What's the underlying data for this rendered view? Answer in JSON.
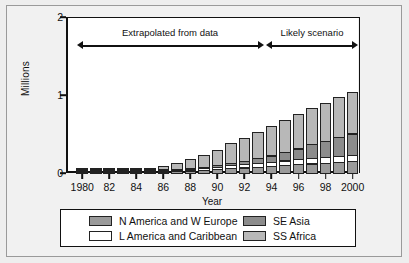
{
  "chart_data": {
    "type": "bar",
    "stacked": true,
    "title": "",
    "xlabel": "Year",
    "ylabel": "Millions",
    "ylim": [
      0,
      2
    ],
    "yticks": [
      "0",
      "1",
      "2"
    ],
    "ytick_values": [
      0,
      1,
      2
    ],
    "grid": false,
    "legend_position": "bottom",
    "x": [
      1980,
      1981,
      1982,
      1983,
      1984,
      1985,
      1986,
      1987,
      1988,
      1989,
      1990,
      1991,
      1992,
      1993,
      1994,
      1995,
      1996,
      1997,
      1998,
      1999,
      2000
    ],
    "xtick_labels": [
      "1980",
      "82",
      "84",
      "86",
      "88",
      "90",
      "92",
      "94",
      "96",
      "98",
      "2000"
    ],
    "xtick_years": [
      1980,
      1982,
      1984,
      1986,
      1988,
      1990,
      1992,
      1994,
      1996,
      1998,
      2000
    ],
    "categories": [
      "1980",
      "1981",
      "1982",
      "1983",
      "1984",
      "1985",
      "1986",
      "1987",
      "1988",
      "1989",
      "1990",
      "1991",
      "1992",
      "1993",
      "1994",
      "1995",
      "1996",
      "1997",
      "1998",
      "1999",
      "2000"
    ],
    "series": [
      {
        "name": "N America and W Europe",
        "color": "#9a9a9a",
        "values": [
          0.0,
          0.0,
          0.0,
          0.0,
          0.005,
          0.01,
          0.02,
          0.03,
          0.04,
          0.05,
          0.06,
          0.07,
          0.08,
          0.09,
          0.1,
          0.11,
          0.12,
          0.13,
          0.14,
          0.15,
          0.16
        ]
      },
      {
        "name": "L America and Caribbean",
        "color": "#ffffff",
        "values": [
          0.0,
          0.0,
          0.0,
          0.0,
          0.005,
          0.01,
          0.02,
          0.025,
          0.03,
          0.035,
          0.04,
          0.05,
          0.055,
          0.06,
          0.065,
          0.07,
          0.075,
          0.08,
          0.085,
          0.09,
          0.095
        ]
      },
      {
        "name": "SE Asia",
        "color": "#8c8c8c",
        "values": [
          0.0,
          0.0,
          0.0,
          0.0,
          0.0,
          0.005,
          0.01,
          0.015,
          0.02,
          0.025,
          0.03,
          0.04,
          0.05,
          0.07,
          0.09,
          0.12,
          0.15,
          0.19,
          0.22,
          0.25,
          0.28
        ]
      },
      {
        "name": "SS Africa",
        "color": "#b8b8b8",
        "values": [
          0.005,
          0.005,
          0.007,
          0.01,
          0.015,
          0.03,
          0.06,
          0.09,
          0.12,
          0.16,
          0.21,
          0.26,
          0.31,
          0.35,
          0.39,
          0.42,
          0.45,
          0.48,
          0.5,
          0.52,
          0.55
        ]
      }
    ],
    "totals": [
      0.005,
      0.005,
      0.007,
      0.01,
      0.025,
      0.055,
      0.11,
      0.16,
      0.21,
      0.27,
      0.34,
      0.42,
      0.495,
      0.57,
      0.645,
      0.72,
      0.795,
      0.88,
      0.945,
      1.01,
      1.085
    ],
    "annotations": [
      {
        "text": "Extrapolated from data",
        "from_year": 1980,
        "to_year": 1993,
        "style": "double-arrow"
      },
      {
        "text": "Likely scenario",
        "from_year": 1994,
        "to_year": 2000,
        "style": "double-arrow"
      }
    ]
  },
  "legend": {
    "entries": [
      {
        "label": "N America and W Europe",
        "color": "#9a9a9a"
      },
      {
        "label": "L America and Caribbean",
        "color": "#ffffff"
      },
      {
        "label": "SE Asia",
        "color": "#8c8c8c"
      },
      {
        "label": "SS Africa",
        "color": "#b8b8b8"
      }
    ]
  }
}
